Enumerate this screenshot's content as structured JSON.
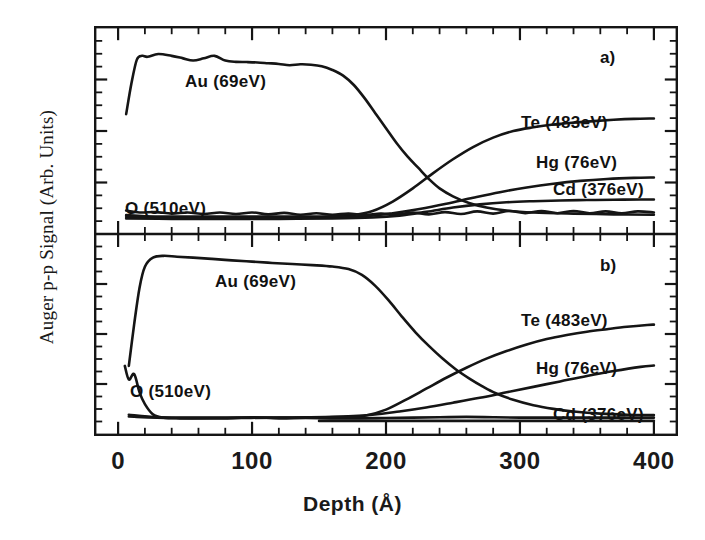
{
  "figure": {
    "ylabel": "Auger p-p Signal (Arb. Units)",
    "xlabel": "Depth (Å)",
    "panel_a_tag": "a)",
    "panel_b_tag": "b)"
  },
  "axes": {
    "xticks": [
      0,
      100,
      200,
      300,
      400
    ],
    "xtick_labels": [
      "0",
      "100",
      "200",
      "300",
      "400"
    ],
    "xlim": [
      -18,
      418
    ],
    "minor_tick_step": 20,
    "y_minor_ticks": 16
  },
  "annotations": {
    "panel_a": [
      {
        "name": "au",
        "text": "Au  (69eV)",
        "x": 185,
        "y": 72
      },
      {
        "name": "o",
        "text": "O  (510eV)",
        "x": 125,
        "y": 199
      },
      {
        "name": "te",
        "text": "Te  (483eV)",
        "x": 521,
        "y": 113
      },
      {
        "name": "hg",
        "text": "Hg  (76eV)",
        "x": 536,
        "y": 153
      },
      {
        "name": "cd",
        "text": "Cd  (376eV)",
        "x": 553,
        "y": 180
      }
    ],
    "panel_b": [
      {
        "name": "au",
        "text": "Au  (69eV)",
        "x": 215,
        "y": 272
      },
      {
        "name": "o",
        "text": "O  (510eV)",
        "x": 130,
        "y": 382
      },
      {
        "name": "te",
        "text": "Te  (483eV)",
        "x": 521,
        "y": 311
      },
      {
        "name": "hg",
        "text": "Hg  (76eV)",
        "x": 536,
        "y": 359
      },
      {
        "name": "cd",
        "text": "Cd  (376eV)",
        "x": 553,
        "y": 405
      }
    ]
  },
  "chart_data": {
    "type": "line",
    "title": "",
    "xlabel": "Depth (Å)",
    "ylabel": "Auger p-p Signal (Arb. Units)",
    "xlim": [
      -18,
      418
    ],
    "ylim": [
      0,
      1
    ],
    "grid": false,
    "legend": "inline-annotations",
    "panels": [
      {
        "id": "a",
        "tag": "a)",
        "series": [
          {
            "name": "Au (69eV)",
            "element": "Au",
            "energy_eV": 69,
            "x": [
              6,
              10,
              14,
              18,
              22,
              30,
              40,
              48,
              56,
              64,
              72,
              80,
              88,
              96,
              104,
              112,
              120,
              128,
              136,
              144,
              152,
              160,
              168,
              176,
              184,
              192,
              200,
              208,
              216,
              224,
              232,
              240,
              250,
              262,
              275,
              290,
              310,
              340,
              370,
              400
            ],
            "y": [
              0.595,
              0.76,
              0.885,
              0.905,
              0.9,
              0.915,
              0.905,
              0.893,
              0.88,
              0.892,
              0.905,
              0.88,
              0.873,
              0.872,
              0.87,
              0.866,
              0.862,
              0.855,
              0.86,
              0.858,
              0.85,
              0.83,
              0.8,
              0.75,
              0.68,
              0.6,
              0.52,
              0.44,
              0.37,
              0.31,
              0.25,
              0.2,
              0.158,
              0.122,
              0.098,
              0.082,
              0.072,
              0.066,
              0.062,
              0.06
            ]
          },
          {
            "name": "Te (483eV)",
            "element": "Te",
            "energy_eV": 483,
            "x": [
              6,
              20,
              40,
              60,
              80,
              100,
              120,
              140,
              160,
              175,
              190,
              205,
              220,
              235,
              250,
              265,
              280,
              295,
              310,
              325,
              340,
              355,
              370,
              385,
              400
            ],
            "y": [
              0.058,
              0.052,
              0.05,
              0.05,
              0.05,
              0.05,
              0.05,
              0.05,
              0.052,
              0.058,
              0.08,
              0.13,
              0.2,
              0.28,
              0.355,
              0.42,
              0.47,
              0.505,
              0.525,
              0.54,
              0.55,
              0.558,
              0.565,
              0.57,
              0.572
            ]
          },
          {
            "name": "Hg (76eV)",
            "element": "Hg",
            "energy_eV": 76,
            "x": [
              6,
              40,
              80,
              120,
              160,
              185,
              205,
              225,
              245,
              265,
              285,
              305,
              325,
              345,
              365,
              385,
              400
            ],
            "y": [
              0.048,
              0.044,
              0.044,
              0.044,
              0.046,
              0.052,
              0.068,
              0.09,
              0.118,
              0.15,
              0.18,
              0.205,
              0.225,
              0.24,
              0.25,
              0.256,
              0.258
            ]
          },
          {
            "name": "Cd (376eV)",
            "element": "Cd",
            "energy_eV": 376,
            "x": [
              6,
              40,
              80,
              120,
              160,
              190,
              210,
              230,
              250,
              270,
              290,
              310,
              330,
              350,
              370,
              390,
              400
            ],
            "y": [
              0.04,
              0.038,
              0.038,
              0.038,
              0.04,
              0.045,
              0.055,
              0.075,
              0.098,
              0.115,
              0.126,
              0.132,
              0.136,
              0.138,
              0.14,
              0.141,
              0.141
            ]
          },
          {
            "name": "O (510eV)",
            "element": "O",
            "energy_eV": 510,
            "x": [
              6,
              16,
              28,
              40,
              52,
              64,
              76,
              88,
              100,
              112,
              124,
              136,
              148,
              160,
              172,
              184,
              196,
              208,
              220,
              232,
              244,
              256,
              268,
              280,
              292,
              304,
              316,
              328,
              340,
              352,
              364,
              376,
              388,
              400
            ],
            "y": [
              0.082,
              0.072,
              0.074,
              0.066,
              0.072,
              0.064,
              0.072,
              0.064,
              0.072,
              0.062,
              0.07,
              0.06,
              0.068,
              0.06,
              0.066,
              0.058,
              0.066,
              0.062,
              0.072,
              0.062,
              0.074,
              0.064,
              0.078,
              0.066,
              0.08,
              0.068,
              0.08,
              0.068,
              0.08,
              0.068,
              0.078,
              0.068,
              0.078,
              0.072
            ]
          }
        ]
      },
      {
        "id": "b",
        "tag": "b)",
        "series": [
          {
            "name": "Au (69eV)",
            "element": "Au",
            "energy_eV": 69,
            "x": [
              8,
              12,
              16,
              20,
              26,
              34,
              44,
              56,
              70,
              85,
              100,
              115,
              130,
              145,
              160,
              172,
              182,
              192,
              202,
              212,
              222,
              232,
              242,
              252,
              262,
              272,
              282,
              295,
              310,
              325,
              340,
              360,
              380,
              400
            ],
            "y": [
              0.33,
              0.56,
              0.76,
              0.875,
              0.925,
              0.935,
              0.93,
              0.925,
              0.918,
              0.91,
              0.903,
              0.896,
              0.89,
              0.884,
              0.876,
              0.862,
              0.83,
              0.77,
              0.69,
              0.6,
              0.515,
              0.44,
              0.372,
              0.312,
              0.262,
              0.218,
              0.18,
              0.144,
              0.114,
              0.094,
              0.08,
              0.068,
              0.062,
              0.06
            ]
          },
          {
            "name": "Te (483eV)",
            "element": "Te",
            "energy_eV": 483,
            "x": [
              8,
              30,
              60,
              90,
              120,
              150,
              170,
              185,
              200,
              215,
              230,
              245,
              260,
              275,
              290,
              305,
              320,
              335,
              350,
              365,
              380,
              395,
              400
            ],
            "y": [
              0.062,
              0.048,
              0.046,
              0.046,
              0.046,
              0.048,
              0.05,
              0.058,
              0.09,
              0.145,
              0.205,
              0.265,
              0.32,
              0.37,
              0.412,
              0.448,
              0.478,
              0.5,
              0.518,
              0.532,
              0.545,
              0.555,
              0.557
            ]
          },
          {
            "name": "Hg (76eV)",
            "element": "Hg",
            "energy_eV": 76,
            "x": [
              8,
              40,
              80,
              120,
              160,
              190,
              210,
              230,
              250,
              270,
              290,
              310,
              330,
              350,
              370,
              390,
              400
            ],
            "y": [
              0.052,
              0.044,
              0.044,
              0.046,
              0.05,
              0.062,
              0.08,
              0.102,
              0.128,
              0.155,
              0.185,
              0.215,
              0.245,
              0.275,
              0.302,
              0.325,
              0.332
            ]
          },
          {
            "name": "Cd (376eV)",
            "element": "Cd",
            "energy_eV": 376,
            "x": [
              150,
              170,
              190,
              210,
              230,
              250,
              270,
              290,
              310,
              330,
              350,
              370,
              390,
              400
            ],
            "y": [
              0.028,
              0.028,
              0.028,
              0.028,
              0.028,
              0.028,
              0.028,
              0.028,
              0.028,
              0.028,
              0.028,
              0.028,
              0.028,
              0.028
            ]
          },
          {
            "name": "O (510eV)",
            "element": "O",
            "energy_eV": 510,
            "x": [
              5,
              8,
              12,
              16,
              20,
              26,
              34,
              46,
              60,
              80,
              100,
              120,
              140,
              160,
              180,
              200,
              220,
              240,
              260,
              280,
              300,
              320,
              340,
              360,
              380,
              400
            ],
            "y": [
              0.33,
              0.255,
              0.285,
              0.185,
              0.12,
              0.064,
              0.046,
              0.042,
              0.042,
              0.042,
              0.048,
              0.042,
              0.044,
              0.042,
              0.042,
              0.044,
              0.046,
              0.048,
              0.05,
              0.048,
              0.046,
              0.046,
              0.046,
              0.046,
              0.046,
              0.046
            ]
          }
        ]
      }
    ]
  }
}
